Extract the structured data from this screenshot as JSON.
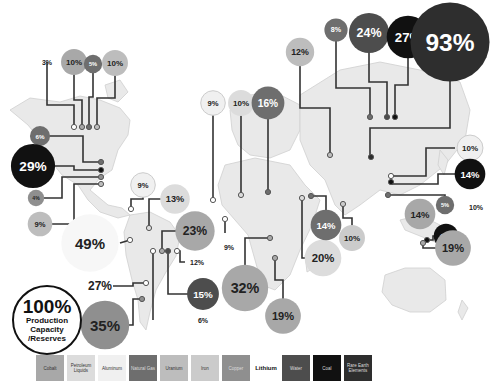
{
  "colors": {
    "cobalt": "#a8a8a8",
    "petroleum_liquids": "#dcdcdc",
    "aluminum": "#f0f0f0",
    "natural_gas": "#6e6e6e",
    "uranium": "#bdbdbd",
    "iron": "#cbcbcb",
    "copper": "#8f8f8f",
    "lithium": "#ffffff",
    "water": "#4d4d4d",
    "coal": "#111111",
    "rare_earth": "#2e2e2e"
  },
  "key": {
    "value": "100%",
    "line1": "Production",
    "line2": "Capacity",
    "line3": "/Reserves"
  },
  "legend": [
    {
      "label": "Cobalt",
      "type": "cobalt"
    },
    {
      "label": "Petroleum Liquids",
      "type": "petroleum_liquids"
    },
    {
      "label": "Aluminum",
      "type": "aluminum"
    },
    {
      "label": "Natural Gas",
      "type": "natural_gas"
    },
    {
      "label": "Uranium",
      "type": "uranium"
    },
    {
      "label": "Iron",
      "type": "iron"
    },
    {
      "label": "Copper",
      "type": "copper"
    },
    {
      "label": "Lithium",
      "type": "lithium"
    },
    {
      "label": "Water",
      "type": "water"
    },
    {
      "label": "Coal",
      "type": "coal"
    },
    {
      "label": "Rare Earth Elements",
      "type": "rare_earth"
    }
  ],
  "chart_data": {
    "type": "bubble-map",
    "title": "",
    "legend_placement": "bottom",
    "regions": [
      {
        "region": "Canada",
        "items": [
          {
            "label": "3%",
            "value": 3,
            "type": "lithium"
          },
          {
            "label": "10%",
            "value": 10,
            "type": "cobalt"
          },
          {
            "label": "5%",
            "value": 5,
            "type": "natural_gas"
          },
          {
            "label": "10%",
            "value": 10,
            "type": "uranium"
          }
        ]
      },
      {
        "region": "United States",
        "items": [
          {
            "label": "6%",
            "value": 6,
            "type": "natural_gas"
          },
          {
            "label": "29%",
            "value": 29,
            "type": "coal"
          },
          {
            "label": "4%",
            "value": 4,
            "type": "copper"
          },
          {
            "label": "9%",
            "value": 9,
            "type": "uranium"
          }
        ]
      },
      {
        "region": "Caribbean / Jamaica",
        "items": [
          {
            "label": "9%",
            "value": 9,
            "type": "aluminum"
          }
        ]
      },
      {
        "region": "Venezuela",
        "items": [
          {
            "label": "13%",
            "value": 13,
            "type": "petroleum_liquids"
          }
        ]
      },
      {
        "region": "Peru / Ecuador",
        "items": [
          {
            "label": "49%",
            "value": 49,
            "type": "lithium"
          }
        ]
      },
      {
        "region": "Brazil",
        "items": [
          {
            "label": "23%",
            "value": 23,
            "type": "cobalt"
          },
          {
            "label": "12%",
            "value": 12,
            "type": "aluminum"
          },
          {
            "label": "15%",
            "value": 15,
            "type": "water"
          }
        ]
      },
      {
        "region": "Argentina / Chile",
        "items": [
          {
            "label": "27%",
            "value": 27,
            "type": "lithium"
          },
          {
            "label": "35%",
            "value": 35,
            "type": "copper"
          },
          {
            "label": "6%",
            "value": 6,
            "type": "lithium"
          }
        ]
      },
      {
        "region": "Guinea",
        "items": [
          {
            "label": "9%",
            "value": 9,
            "type": "aluminum"
          }
        ]
      },
      {
        "region": "DR Congo",
        "items": [
          {
            "label": "32%",
            "value": 32,
            "type": "cobalt"
          }
        ]
      },
      {
        "region": "Southern Africa",
        "items": [
          {
            "label": "19%",
            "value": 19,
            "type": "cobalt"
          }
        ]
      },
      {
        "region": "Arabian Peninsula",
        "items": [
          {
            "label": "20%",
            "value": 20,
            "type": "petroleum_liquids"
          },
          {
            "label": "14%",
            "value": 14,
            "type": "natural_gas"
          }
        ]
      },
      {
        "region": "India",
        "items": [
          {
            "label": "10%",
            "value": 10,
            "type": "iron"
          }
        ]
      },
      {
        "region": "Europe",
        "items": [
          {
            "label": "9%",
            "value": 9,
            "type": "aluminum"
          },
          {
            "label": "10%",
            "value": 10,
            "type": "petroleum_liquids"
          },
          {
            "label": "16%",
            "value": 16,
            "type": "natural_gas"
          }
        ]
      },
      {
        "region": "Russia",
        "items": [
          {
            "label": "12%",
            "value": 12,
            "type": "uranium"
          },
          {
            "label": "8%",
            "value": 8,
            "type": "natural_gas"
          },
          {
            "label": "24%",
            "value": 24,
            "type": "water"
          },
          {
            "label": "27%",
            "value": 27,
            "type": "coal"
          }
        ]
      },
      {
        "region": "China",
        "items": [
          {
            "label": "93%",
            "value": 93,
            "type": "rare_earth"
          },
          {
            "label": "10%",
            "value": 10,
            "type": "aluminum"
          },
          {
            "label": "14%",
            "value": 14,
            "type": "coal"
          },
          {
            "label": "5%",
            "value": 5,
            "type": "natural_gas"
          },
          {
            "label": "10%",
            "value": 10,
            "type": "lithium"
          }
        ]
      },
      {
        "region": "Southeast Asia",
        "items": [
          {
            "label": "14%",
            "value": 14,
            "type": "cobalt"
          },
          {
            "label": "6%",
            "value": 6,
            "type": "natural_gas"
          },
          {
            "label": "7%",
            "value": 7,
            "type": "copper"
          }
        ]
      },
      {
        "region": "Australia",
        "items": [
          {
            "label": "9%",
            "value": 9,
            "type": "coal"
          },
          {
            "label": "19%",
            "value": 19,
            "type": "cobalt"
          },
          {
            "label": "36%",
            "value": 36,
            "type": "lithium"
          },
          {
            "label": "27%",
            "value": 27,
            "type": "uranium"
          },
          {
            "label": "13%",
            "value": 13,
            "type": "iron"
          }
        ]
      }
    ]
  }
}
